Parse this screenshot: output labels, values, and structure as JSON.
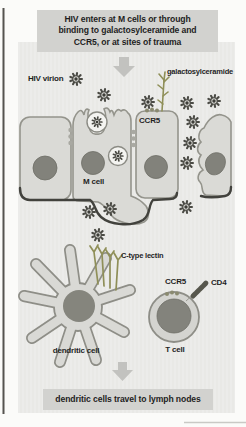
{
  "figure": {
    "top_box": {
      "line1": "HIV enters at M cells or through",
      "line2": "binding to galactosylceramide and",
      "line3": "CCR5, or at sites of trauma"
    },
    "bottom_box": {
      "text": "dendritic cells travel to lymph nodes"
    },
    "labels": {
      "hiv_virion": "HIV virion",
      "galactosylceramide": "galactosylceramide",
      "ccr5": "CCR5",
      "m_cell": "M cell",
      "c_type_lectin": "C-type lectin",
      "dendritic_cell": "dendritic cell",
      "cd4": "CD4",
      "t_cell": "T cell"
    },
    "icons": {
      "hiv_virion_icon": "spiky-virus-particle",
      "down_arrow_icon": "block-arrow-down",
      "galactosylceramide_icon": "branched-glycolipid",
      "c_type_lectin_icon": "forked-receptor-cluster",
      "ccr5_receptor_icon": "membrane-bead-trio",
      "cd4_receptor_icon": "segmented-rod-receptor"
    },
    "colors": {
      "panel_bg": "#ebebe8",
      "box_bg": "#d2d2cf",
      "cell_fill": "#dadad6",
      "cell_outline": "#94948c",
      "nucleus": "#82827b",
      "virion": "#4b4b45",
      "receptor_olive": "#8f8f58",
      "arrow": "#c2c2bf",
      "basement_membrane": "#42423d",
      "text": "#1f1f1f"
    }
  }
}
